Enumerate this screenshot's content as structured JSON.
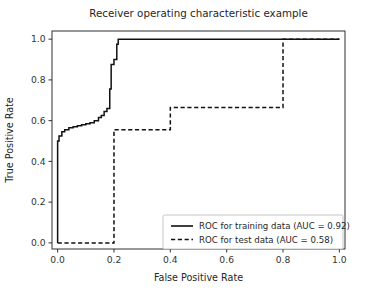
{
  "chart_data": {
    "type": "line",
    "title": "Receiver operating characteristic example",
    "xlabel": "False Positive Rate",
    "ylabel": "True Positive Rate",
    "xlim": [
      -0.02,
      1.02
    ],
    "ylim": [
      -0.03,
      1.04
    ],
    "grid": false,
    "legend_position": "lower right",
    "xticks": [
      0.0,
      0.2,
      0.4,
      0.6,
      0.8,
      1.0
    ],
    "yticks": [
      0.0,
      0.2,
      0.4,
      0.6,
      0.8,
      1.0
    ],
    "xticklabels": [
      "0.0",
      "0.2",
      "0.4",
      "0.6",
      "0.8",
      "1.0"
    ],
    "yticklabels": [
      "0.0",
      "0.2",
      "0.4",
      "0.6",
      "0.8",
      "1.0"
    ],
    "series": [
      {
        "name": "ROC for training data (AUC = 0.92)",
        "style": "solid",
        "color": "#111111",
        "auc": 0.92,
        "x": [
          0.0,
          0.0,
          0.005,
          0.005,
          0.015,
          0.015,
          0.025,
          0.025,
          0.04,
          0.04,
          0.055,
          0.055,
          0.07,
          0.07,
          0.085,
          0.085,
          0.1,
          0.1,
          0.115,
          0.115,
          0.13,
          0.13,
          0.145,
          0.145,
          0.155,
          0.155,
          0.165,
          0.165,
          0.175,
          0.175,
          0.185,
          0.185,
          0.19,
          0.19,
          0.2,
          0.2,
          0.21,
          0.21,
          0.215,
          0.215,
          1.0
        ],
        "y": [
          0.0,
          0.5,
          0.5,
          0.525,
          0.525,
          0.545,
          0.545,
          0.555,
          0.555,
          0.565,
          0.565,
          0.57,
          0.57,
          0.575,
          0.575,
          0.58,
          0.58,
          0.585,
          0.585,
          0.59,
          0.59,
          0.6,
          0.6,
          0.615,
          0.615,
          0.625,
          0.625,
          0.645,
          0.645,
          0.66,
          0.66,
          0.755,
          0.755,
          0.875,
          0.875,
          0.9,
          0.9,
          0.975,
          0.975,
          1.0,
          1.0
        ]
      },
      {
        "name": "ROC for test data (AUC = 0.58)",
        "style": "dashed",
        "color": "#111111",
        "auc": 0.58,
        "x": [
          0.0,
          0.2,
          0.2,
          0.4,
          0.4,
          0.8,
          0.8,
          1.0
        ],
        "y": [
          0.0,
          0.0,
          0.555,
          0.555,
          0.665,
          0.665,
          1.0,
          1.0
        ]
      }
    ]
  },
  "legend": {
    "entries": [
      {
        "label": "ROC for training data (AUC = 0.92)",
        "style": "solid"
      },
      {
        "label": "ROC for test data (AUC = 0.58)",
        "style": "dashed"
      }
    ]
  }
}
